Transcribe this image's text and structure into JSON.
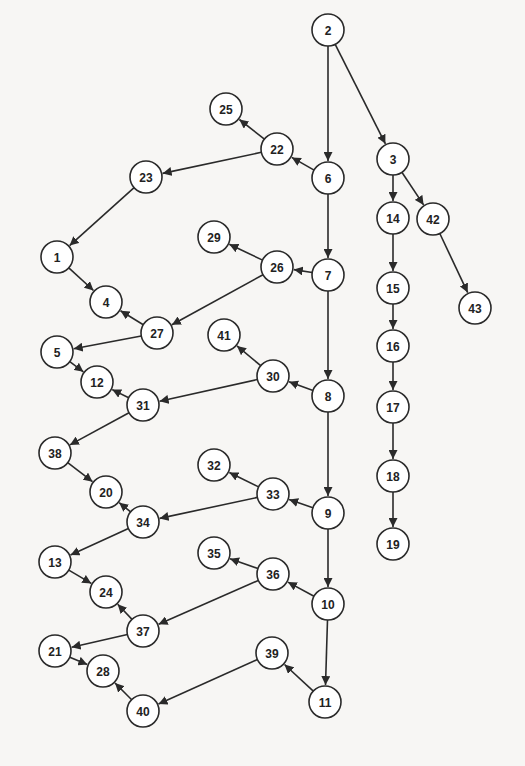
{
  "diagram": {
    "type": "directed-tree",
    "colors": {
      "background": "#f7f6f4",
      "stroke": "#2a2a2a",
      "node_fill": "#ffffff",
      "text": "#222222"
    },
    "node_radius": 16,
    "nodes": [
      {
        "id": "2",
        "x": 328,
        "y": 30
      },
      {
        "id": "3",
        "x": 393,
        "y": 159
      },
      {
        "id": "6",
        "x": 328,
        "y": 178
      },
      {
        "id": "22",
        "x": 277,
        "y": 149
      },
      {
        "id": "25",
        "x": 226,
        "y": 109
      },
      {
        "id": "23",
        "x": 146,
        "y": 177
      },
      {
        "id": "1",
        "x": 57,
        "y": 257
      },
      {
        "id": "4",
        "x": 106,
        "y": 302
      },
      {
        "id": "7",
        "x": 328,
        "y": 275
      },
      {
        "id": "26",
        "x": 277,
        "y": 267
      },
      {
        "id": "29",
        "x": 214,
        "y": 237
      },
      {
        "id": "27",
        "x": 157,
        "y": 333
      },
      {
        "id": "5",
        "x": 57,
        "y": 352
      },
      {
        "id": "8",
        "x": 328,
        "y": 396
      },
      {
        "id": "30",
        "x": 273,
        "y": 376
      },
      {
        "id": "41",
        "x": 224,
        "y": 335
      },
      {
        "id": "31",
        "x": 143,
        "y": 405
      },
      {
        "id": "12",
        "x": 97,
        "y": 382
      },
      {
        "id": "38",
        "x": 55,
        "y": 453
      },
      {
        "id": "20",
        "x": 106,
        "y": 492
      },
      {
        "id": "9",
        "x": 328,
        "y": 513
      },
      {
        "id": "33",
        "x": 273,
        "y": 494
      },
      {
        "id": "32",
        "x": 214,
        "y": 465
      },
      {
        "id": "34",
        "x": 143,
        "y": 522
      },
      {
        "id": "13",
        "x": 55,
        "y": 562
      },
      {
        "id": "24",
        "x": 106,
        "y": 592
      },
      {
        "id": "10",
        "x": 328,
        "y": 604
      },
      {
        "id": "36",
        "x": 273,
        "y": 574
      },
      {
        "id": "35",
        "x": 214,
        "y": 553
      },
      {
        "id": "37",
        "x": 143,
        "y": 631
      },
      {
        "id": "21",
        "x": 55,
        "y": 651
      },
      {
        "id": "28",
        "x": 103,
        "y": 671
      },
      {
        "id": "11",
        "x": 325,
        "y": 702
      },
      {
        "id": "39",
        "x": 272,
        "y": 653
      },
      {
        "id": "40",
        "x": 143,
        "y": 711
      },
      {
        "id": "14",
        "x": 393,
        "y": 218
      },
      {
        "id": "42",
        "x": 433,
        "y": 219
      },
      {
        "id": "43",
        "x": 475,
        "y": 308
      },
      {
        "id": "15",
        "x": 393,
        "y": 288
      },
      {
        "id": "16",
        "x": 393,
        "y": 346
      },
      {
        "id": "17",
        "x": 393,
        "y": 407
      },
      {
        "id": "18",
        "x": 393,
        "y": 476
      },
      {
        "id": "19",
        "x": 393,
        "y": 544
      }
    ],
    "edges": [
      [
        "2",
        "6"
      ],
      [
        "2",
        "3"
      ],
      [
        "3",
        "14"
      ],
      [
        "3",
        "42"
      ],
      [
        "42",
        "43"
      ],
      [
        "14",
        "15"
      ],
      [
        "15",
        "16"
      ],
      [
        "16",
        "17"
      ],
      [
        "17",
        "18"
      ],
      [
        "18",
        "19"
      ],
      [
        "6",
        "7"
      ],
      [
        "6",
        "22"
      ],
      [
        "22",
        "25"
      ],
      [
        "22",
        "23"
      ],
      [
        "23",
        "1"
      ],
      [
        "1",
        "4"
      ],
      [
        "7",
        "8"
      ],
      [
        "7",
        "26"
      ],
      [
        "26",
        "29"
      ],
      [
        "26",
        "27"
      ],
      [
        "27",
        "4"
      ],
      [
        "27",
        "5"
      ],
      [
        "5",
        "12"
      ],
      [
        "8",
        "9"
      ],
      [
        "8",
        "30"
      ],
      [
        "30",
        "41"
      ],
      [
        "30",
        "31"
      ],
      [
        "31",
        "12"
      ],
      [
        "31",
        "38"
      ],
      [
        "38",
        "20"
      ],
      [
        "9",
        "10"
      ],
      [
        "9",
        "33"
      ],
      [
        "33",
        "32"
      ],
      [
        "33",
        "34"
      ],
      [
        "34",
        "20"
      ],
      [
        "34",
        "13"
      ],
      [
        "13",
        "24"
      ],
      [
        "10",
        "11"
      ],
      [
        "10",
        "36"
      ],
      [
        "36",
        "35"
      ],
      [
        "36",
        "37"
      ],
      [
        "37",
        "24"
      ],
      [
        "37",
        "21"
      ],
      [
        "21",
        "28"
      ],
      [
        "11",
        "39"
      ],
      [
        "39",
        "40"
      ],
      [
        "40",
        "28"
      ]
    ]
  }
}
